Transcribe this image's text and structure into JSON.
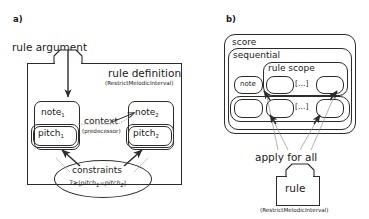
{
  "figure": {
    "panel_a": {
      "letter": "a)",
      "rule_argument_label": "rule argument",
      "rule_definition_title": "rule definition",
      "rule_definition_subtitle": "(RestrictMelodicInterval)",
      "note1": "note",
      "note1_sub": "1",
      "pitch1": "pitch",
      "pitch1_sub": "1",
      "note2": "note",
      "note2_sub": "2",
      "pitch2": "pitch",
      "pitch2_sub": "2",
      "context_label": "context",
      "context_sublabel": "(predecessor)",
      "constraints_title": "constraints",
      "constraints_formula_lhs": "7≥",
      "constraints_formula_bar_open": "|",
      "constraints_formula_a": "pitch",
      "constraints_formula_a_sub": "1",
      "constraints_formula_op": "−",
      "constraints_formula_b": "pitch",
      "constraints_formula_b_sub": "2",
      "constraints_formula_bar_close": "|"
    },
    "panel_b": {
      "letter": "b)",
      "score_label": "score",
      "sequential_label": "sequential",
      "rule_scope_label": "rule scope",
      "note_label": "note",
      "ellipsis_top": "[…]",
      "ellipsis_bottom": "[…]",
      "apply_for_all_label": "apply for all",
      "rule_label": "rule",
      "rule_subtitle": "(RestrictMelodicInterval)"
    }
  },
  "colors": {
    "stroke": "#2b2b2b",
    "light_stroke": "#8c8c8c",
    "background": "#ffffff",
    "text": "#1a1a1a"
  }
}
